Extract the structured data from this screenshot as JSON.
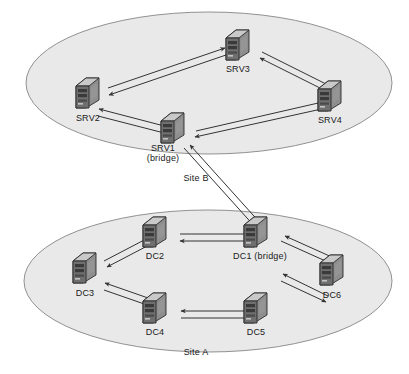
{
  "diagram": {
    "background_color": "#ffffff",
    "site_fill_color": "#e9e9e9",
    "site_stroke_color": "#9a9a9a",
    "arrow_color": "#3a3a3a",
    "icon_semantic_name": "server-tower-icon"
  },
  "sites": [
    {
      "id": "site-b",
      "label": "Site B",
      "label_x": 196,
      "label_y": 173,
      "ellipse": {
        "cx": 209,
        "cy": 83,
        "rx": 183,
        "ry": 71
      }
    },
    {
      "id": "site-a",
      "label": "Site A",
      "label_x": 196,
      "label_y": 347,
      "ellipse": {
        "cx": 208,
        "cy": 281,
        "rx": 184,
        "ry": 71
      }
    }
  ],
  "nodes": [
    {
      "id": "srv3",
      "site": "site-b",
      "label": "SRV3",
      "label_lines": [
        "SRV3"
      ],
      "x": 238,
      "y": 45,
      "label_x": 238,
      "label_y": 64
    },
    {
      "id": "srv2",
      "site": "site-b",
      "label": "SRV2",
      "label_lines": [
        "SRV2"
      ],
      "x": 88,
      "y": 93,
      "label_x": 88,
      "label_y": 113
    },
    {
      "id": "srv4",
      "site": "site-b",
      "label": "SRV4",
      "label_lines": [
        "SRV4"
      ],
      "x": 330,
      "y": 96,
      "label_x": 330,
      "label_y": 115
    },
    {
      "id": "srv1",
      "site": "site-b",
      "label": "SRV1 (bridge)",
      "label_lines": [
        "SRV1",
        "(bridge)"
      ],
      "x": 173,
      "y": 128,
      "label_x": 163,
      "label_y": 143
    },
    {
      "id": "dc1",
      "site": "site-a",
      "label": "DC1 (bridge)",
      "label_lines": [
        "DC1 (bridge)"
      ],
      "x": 256,
      "y": 232,
      "label_x": 260,
      "label_y": 251
    },
    {
      "id": "dc2",
      "site": "site-a",
      "label": "DC2",
      "label_lines": [
        "DC2"
      ],
      "x": 155,
      "y": 232,
      "label_x": 155,
      "label_y": 251
    },
    {
      "id": "dc3",
      "site": "site-a",
      "label": "DC3",
      "label_lines": [
        "DC3"
      ],
      "x": 85,
      "y": 268,
      "label_x": 85,
      "label_y": 288
    },
    {
      "id": "dc4",
      "site": "site-a",
      "label": "DC4",
      "label_lines": [
        "DC4"
      ],
      "x": 155,
      "y": 308,
      "label_x": 155,
      "label_y": 327
    },
    {
      "id": "dc5",
      "site": "site-a",
      "label": "DC5",
      "label_lines": [
        "DC5"
      ],
      "x": 256,
      "y": 308,
      "label_x": 256,
      "label_y": 327
    },
    {
      "id": "dc6",
      "site": "site-a",
      "label": "DC6",
      "label_lines": [
        "DC6"
      ],
      "x": 332,
      "y": 270,
      "label_x": 332,
      "label_y": 290
    }
  ],
  "links": [
    {
      "id": "link-srv2-srv3",
      "from": "srv2",
      "to": "srv3",
      "direction": "bidirectional",
      "scope": "intra-site"
    },
    {
      "id": "link-srv3-srv4",
      "from": "srv3",
      "to": "srv4",
      "direction": "bidirectional",
      "scope": "intra-site"
    },
    {
      "id": "link-srv4-srv1",
      "from": "srv4",
      "to": "srv1",
      "direction": "bidirectional",
      "scope": "intra-site"
    },
    {
      "id": "link-srv1-srv2",
      "from": "srv1",
      "to": "srv2",
      "direction": "bidirectional",
      "scope": "intra-site"
    },
    {
      "id": "link-srv1-dc1",
      "from": "srv1",
      "to": "dc1",
      "direction": "bidirectional",
      "scope": "inter-site"
    },
    {
      "id": "link-dc2-dc1",
      "from": "dc2",
      "to": "dc1",
      "direction": "bidirectional",
      "scope": "intra-site"
    },
    {
      "id": "link-dc1-dc6",
      "from": "dc1",
      "to": "dc6",
      "direction": "bidirectional",
      "scope": "intra-site"
    },
    {
      "id": "link-dc6-dc5",
      "from": "dc6",
      "to": "dc5",
      "direction": "bidirectional",
      "scope": "intra-site"
    },
    {
      "id": "link-dc5-dc4",
      "from": "dc5",
      "to": "dc4",
      "direction": "bidirectional",
      "scope": "intra-site"
    },
    {
      "id": "link-dc4-dc3",
      "from": "dc4",
      "to": "dc3",
      "direction": "bidirectional",
      "scope": "intra-site"
    },
    {
      "id": "link-dc3-dc2",
      "from": "dc3",
      "to": "dc2",
      "direction": "bidirectional",
      "scope": "intra-site"
    }
  ]
}
